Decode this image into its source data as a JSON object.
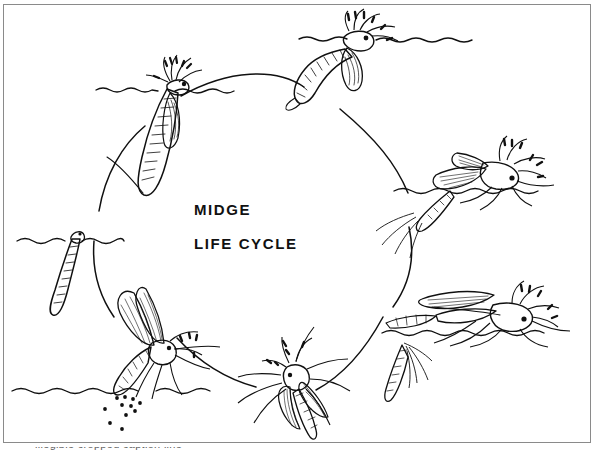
{
  "figure": {
    "title_line1": "MIDGE",
    "title_line2": "LIFE CYCLE",
    "frame_color": "#8a8a8a",
    "ink_color": "#101010",
    "background_color": "#ffffff",
    "caption_partial": "illegible cropped caption line"
  },
  "diagram": {
    "type": "life-cycle-diagram",
    "arrangement": "clockwise circle",
    "stage_count": 6,
    "stages": [
      {
        "id": "pupa-hanging",
        "name": "pupa hanging at water surface",
        "position": "upper-left",
        "x": 152,
        "y": 130,
        "has_water_line": true
      },
      {
        "id": "pupa-emerging",
        "name": "pupa emerging at water surface",
        "position": "top",
        "x": 355,
        "y": 52,
        "has_water_line": true
      },
      {
        "id": "adult-emerging",
        "name": "adult emerging from pupal skin",
        "position": "right",
        "x": 482,
        "y": 175,
        "has_water_line": true
      },
      {
        "id": "adult-resting",
        "name": "adult at rest on water with shed skin",
        "position": "lower-right",
        "x": 480,
        "y": 312,
        "has_water_line": true
      },
      {
        "id": "pupal-exuvia",
        "name": "empty pupal skin (exuvia)",
        "position": "lower-right",
        "x": 392,
        "y": 355,
        "has_water_line": false
      },
      {
        "id": "adult-flying",
        "name": "adult midge in flight",
        "position": "bottom",
        "x": 292,
        "y": 380,
        "has_water_line": false
      },
      {
        "id": "female-laying-eggs",
        "name": "female laying eggs into water",
        "position": "lower-left",
        "x": 130,
        "y": 340,
        "has_water_line": true
      },
      {
        "id": "larva",
        "name": "larva (bloodworm) below water line",
        "position": "left",
        "x": 58,
        "y": 250,
        "has_water_line": true
      }
    ],
    "eggs": {
      "label": "eggs",
      "count": 11,
      "color": "#101010"
    }
  }
}
